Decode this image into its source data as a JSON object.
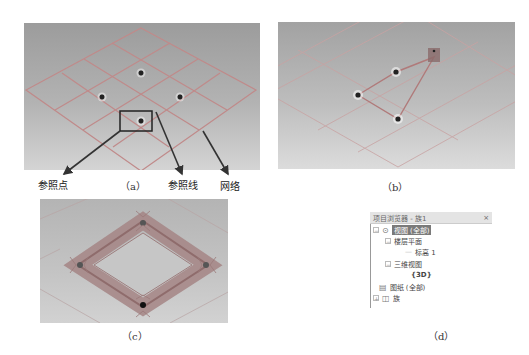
{
  "figure": {
    "panel_a": {
      "caption": "（a）",
      "labels": {
        "reference_point": "参照点",
        "reference_line": "参照线",
        "grid": "网络"
      }
    },
    "panel_b": {
      "caption": "（b）"
    },
    "panel_c": {
      "caption": "（c）"
    },
    "panel_d": {
      "caption": "（d）",
      "browser": {
        "title": "项目浏览器 - 族1",
        "close_label": "×",
        "items": [
          {
            "label": "视图 (全部)",
            "toggle": "−",
            "selected": true
          },
          {
            "label": "楼层平面",
            "toggle": "−"
          },
          {
            "label": "标高 1"
          },
          {
            "label": "三维视图",
            "toggle": "−"
          },
          {
            "label": "{3D}"
          },
          {
            "label": "图纸 (全部)"
          },
          {
            "label": "族",
            "toggle": "+"
          }
        ]
      }
    },
    "colors": {
      "grid_line": "#c08a8a",
      "reference_line": "#b07a7a",
      "point": "#222222",
      "highlight_box": "#222222",
      "arrow": "#333333",
      "selected_bg": "#7a7a7a"
    }
  }
}
